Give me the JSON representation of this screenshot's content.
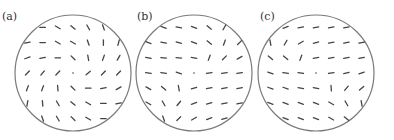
{
  "figure": {
    "colors": {
      "circle": "#7a7a7a",
      "mark": "#444444",
      "label": "#333333",
      "background": "#ffffff"
    },
    "grid": {
      "spacing": 15.2,
      "mark_length": 5.5
    },
    "panels": [
      {
        "label": "(a)",
        "center": [
          73,
          73
        ],
        "radius": 58,
        "label_pos": [
          2,
          20
        ],
        "rows": [
          [
            0,
            30,
            40,
            60,
            70
          ],
          [
            -10,
            0,
            30,
            30,
            70,
            90,
            -75
          ],
          [
            -20,
            -10,
            0,
            45,
            80,
            -70,
            -60
          ],
          [
            -45,
            -50,
            -45,
            "dot",
            -40,
            -45,
            -45
          ],
          [
            -70,
            -70,
            85,
            45,
            0,
            -10,
            -30
          ],
          [
            -80,
            85,
            60,
            40,
            30,
            0,
            -10
          ],
          [
            70,
            60,
            45,
            30,
            0
          ]
        ]
      },
      {
        "label": "(b)",
        "center": [
          194,
          73
        ],
        "radius": 58,
        "label_pos": [
          137,
          20
        ],
        "rows": [
          [
            20,
            10,
            20,
            40,
            -60
          ],
          [
            20,
            10,
            15,
            20,
            40,
            -70,
            -45
          ],
          [
            10,
            5,
            5,
            10,
            -70,
            -45,
            -30
          ],
          [
            10,
            10,
            20,
            "dot",
            -10,
            -10,
            -10
          ],
          [
            30,
            40,
            80,
            -15,
            -10,
            -10,
            -10
          ],
          [
            30,
            60,
            -50,
            -20,
            -15,
            -10,
            -10
          ],
          [
            70,
            -45,
            -30,
            -20,
            -15
          ]
        ]
      },
      {
        "label": "(c)",
        "center": [
          316,
          73
        ],
        "radius": 58,
        "label_pos": [
          260,
          20
        ],
        "rows": [
          [
            -20,
            -10,
            -10,
            -10,
            -10
          ],
          [
            80,
            -60,
            -30,
            -15,
            -10,
            -10,
            -10
          ],
          [
            40,
            40,
            -70,
            -10,
            -10,
            -10,
            -10
          ],
          [
            20,
            10,
            10,
            "dot",
            -10,
            -15,
            -20
          ],
          [
            20,
            20,
            10,
            10,
            85,
            -50,
            -40
          ],
          [
            20,
            20,
            20,
            20,
            30,
            60,
            80
          ],
          [
            20,
            20,
            20,
            30,
            40
          ]
        ]
      }
    ]
  }
}
